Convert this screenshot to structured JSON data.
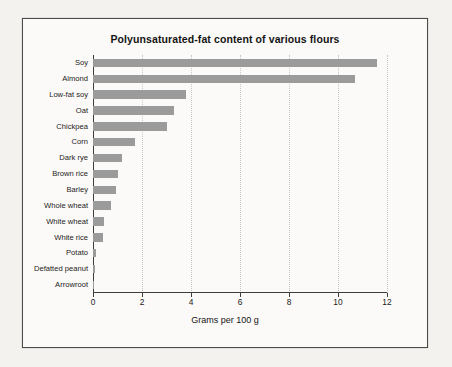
{
  "page": {
    "background_color": "#f3f2ef",
    "frame_color": "#4a4a4a",
    "plot_background": "#fbfaf8",
    "bleed_text": "                                                                   \n                                                                   \n                                                                   \n                                                                   \n                                                                   \n                                                                   \n                                                                   \n                                                                   \n                                                                   \n                                                                   \n                                                                   \n                                                                   \n                                                                   \n                                                                   "
  },
  "chart_data": {
    "type": "bar",
    "orientation": "horizontal",
    "title": "Polyunsaturated-fat content of various flours",
    "xlabel": "Grams per 100 g",
    "ylabel": "",
    "xlim": [
      0,
      12
    ],
    "xticks": [
      0,
      2,
      4,
      6,
      8,
      10,
      12
    ],
    "xtick_labels": [
      "0",
      "2",
      "4",
      "6",
      "8",
      "10",
      "12"
    ],
    "grid": "vertical-dotted",
    "legend": "none",
    "bar_color": "#9b9b9b",
    "categories": [
      "Soy",
      "Almond",
      "Low-fat soy",
      "Oat",
      "Chickpea",
      "Corn",
      "Dark rye",
      "Brown rice",
      "Barley",
      "Whole wheat",
      "White wheat",
      "White rice",
      "Potato",
      "Defatted peanut",
      "Arrowroot"
    ],
    "values": [
      11.6,
      10.7,
      3.8,
      3.3,
      3.0,
      1.7,
      1.2,
      1.0,
      0.95,
      0.75,
      0.45,
      0.4,
      0.12,
      0.1,
      0.03
    ]
  }
}
